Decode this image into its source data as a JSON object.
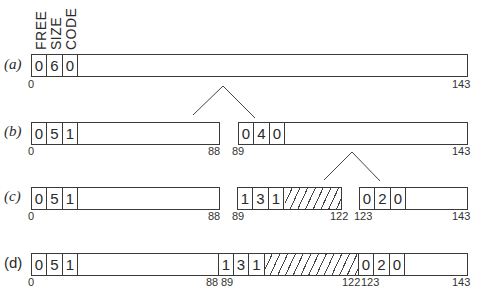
{
  "headers": [
    "FREE",
    "SIZE",
    "CODE"
  ],
  "rows": [
    {
      "label": "(a)",
      "blocks": [
        {
          "start": "0",
          "end": "143",
          "cells": [
            "0",
            "6",
            "0"
          ],
          "hatched": false
        }
      ]
    },
    {
      "label": "(b)",
      "blocks": [
        {
          "start": "0",
          "end": "88",
          "cells": [
            "0",
            "5",
            "1"
          ],
          "hatched": false
        },
        {
          "start": "89",
          "end": "143",
          "cells": [
            "0",
            "4",
            "0"
          ],
          "hatched": false
        }
      ]
    },
    {
      "label": "(c)",
      "blocks": [
        {
          "start": "0",
          "end": "88",
          "cells": [
            "0",
            "5",
            "1"
          ],
          "hatched": false
        },
        {
          "start": "89",
          "end": "122",
          "cells": [
            "1",
            "3",
            "1"
          ],
          "hatched": true
        },
        {
          "start": "123",
          "end": "143",
          "cells": [
            "0",
            "2",
            "0"
          ],
          "hatched": false
        }
      ]
    },
    {
      "label": "(d)",
      "blocks": [
        {
          "start": "0",
          "end": "88",
          "cells": [
            "0",
            "5",
            "1"
          ],
          "hatched": false
        },
        {
          "start": "89",
          "end": "122",
          "cells": [
            "1",
            "3",
            "1"
          ],
          "hatched": true
        },
        {
          "start": "123",
          "end": "143",
          "cells": [
            "0",
            "2",
            "0"
          ],
          "hatched": false
        }
      ]
    }
  ]
}
